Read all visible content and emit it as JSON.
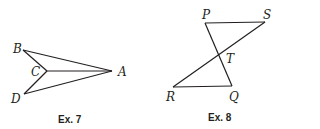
{
  "figures": [
    {
      "caption": "Ex. 7",
      "labels": {
        "B": "B",
        "C": "C",
        "A": "A",
        "D": "D"
      },
      "segments": [
        "BA",
        "BC",
        "CA",
        "CD",
        "DA"
      ]
    },
    {
      "caption": "Ex. 8",
      "labels": {
        "P": "P",
        "S": "S",
        "T": "T",
        "R": "R",
        "Q": "Q"
      },
      "segments": [
        "PS",
        "SR",
        "RQ",
        "QP"
      ]
    }
  ],
  "colors": {
    "ink": "#231f20",
    "background": "#ffffff"
  }
}
